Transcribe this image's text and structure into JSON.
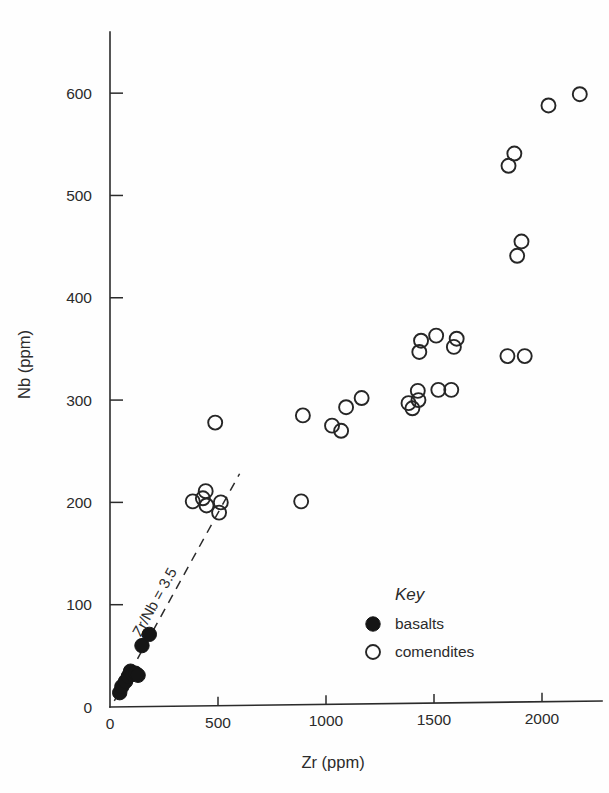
{
  "chart_data": {
    "type": "scatter",
    "title": "",
    "xlabel": "Zr (ppm)",
    "ylabel": "Nb (ppm)",
    "xlim": [
      0,
      2250
    ],
    "ylim": [
      0,
      650
    ],
    "xticks": [
      0,
      500,
      1000,
      1500,
      2000
    ],
    "yticks": [
      0,
      100,
      200,
      300,
      400,
      500,
      600
    ],
    "xtick_labels": [
      "0",
      "500",
      "1000",
      "1500",
      "2000"
    ],
    "ytick_labels": [
      "0",
      "100",
      "200",
      "300",
      "400",
      "500",
      "600"
    ],
    "grid": false,
    "legend_position": "inside lower-right",
    "annotations": [
      {
        "text": "Zr/Nb = 3.5",
        "type": "reference-line-label",
        "rotation": -58,
        "line": {
          "x_start": 20,
          "y_start": 6,
          "x_end": 600,
          "y_end": 228,
          "style": "dashed",
          "slope_ratio": 3.5
        }
      }
    ],
    "series": [
      {
        "name": "basalts",
        "marker": "filled-circle",
        "color": "#151515",
        "points": [
          [
            45,
            14
          ],
          [
            55,
            20
          ],
          [
            72,
            25
          ],
          [
            85,
            30
          ],
          [
            95,
            35
          ],
          [
            105,
            32
          ],
          [
            118,
            33
          ],
          [
            130,
            31
          ],
          [
            148,
            60
          ],
          [
            182,
            71
          ]
        ]
      },
      {
        "name": "comendites",
        "marker": "open-circle",
        "color": "#262626",
        "points": [
          [
            383,
            201
          ],
          [
            430,
            204
          ],
          [
            443,
            211
          ],
          [
            447,
            197
          ],
          [
            505,
            190
          ],
          [
            487,
            278
          ],
          [
            513,
            200
          ],
          [
            885,
            201
          ],
          [
            893,
            285
          ],
          [
            1028,
            275
          ],
          [
            1070,
            270
          ],
          [
            1093,
            293
          ],
          [
            1165,
            302
          ],
          [
            1382,
            297
          ],
          [
            1400,
            292
          ],
          [
            1425,
            309
          ],
          [
            1428,
            300
          ],
          [
            1432,
            347
          ],
          [
            1440,
            358
          ],
          [
            1510,
            363
          ],
          [
            1520,
            310
          ],
          [
            1580,
            310
          ],
          [
            1592,
            352
          ],
          [
            1605,
            360
          ],
          [
            1840,
            343
          ],
          [
            1845,
            529
          ],
          [
            1872,
            541
          ],
          [
            1885,
            441
          ],
          [
            1905,
            455
          ],
          [
            1920,
            343
          ],
          [
            2030,
            588
          ],
          [
            2175,
            599
          ]
        ]
      }
    ]
  },
  "legend": {
    "title": "Key",
    "entries": [
      {
        "label": "basalts",
        "marker": "filled-circle"
      },
      {
        "label": "comendites",
        "marker": "open-circle"
      }
    ]
  },
  "colors": {
    "axis": "#2b2b2b",
    "marker_stroke": "#262626",
    "marker_fill": "#151515",
    "background": "#fefefe"
  }
}
